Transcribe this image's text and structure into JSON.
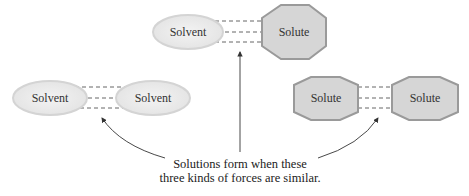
{
  "diagram": {
    "groups": {
      "top": {
        "left": "Solvent",
        "right": "Solute"
      },
      "left": {
        "left": "Solvent",
        "right": "Solvent"
      },
      "right": {
        "left": "Solute",
        "right": "Solute"
      }
    },
    "caption": {
      "line1": "Solutions form when these",
      "line2": "three kinds of forces are similar."
    },
    "colors": {
      "solvent_fill": "#ececec",
      "solvent_stroke": "#d4d4d4",
      "solute_fill": "#d6d6d6",
      "solute_stroke": "#9a9a9a",
      "dash": "#666666",
      "arrow": "#333333"
    }
  }
}
